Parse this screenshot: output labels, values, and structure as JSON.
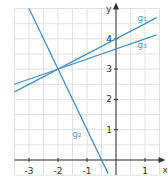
{
  "chart_data": {
    "type": "line",
    "title": "",
    "xlabel": "x",
    "ylabel": "y",
    "xlim": [
      -3.5,
      1.5
    ],
    "ylim": [
      -0.5,
      5.0
    ],
    "grid": true,
    "grid_step": 0.5,
    "x_ticks": [
      -3,
      -2,
      -1,
      1
    ],
    "x_tick_labels": [
      "-3",
      "-2",
      "-1",
      "1"
    ],
    "y_ticks": [
      1,
      2,
      3,
      4
    ],
    "y_tick_labels": [
      "1",
      "2",
      "3",
      "4"
    ],
    "series": [
      {
        "name": "g1",
        "label": "g₁",
        "slope": 0.5,
        "intercept": 4,
        "points": [
          [
            -3.5,
            2.25
          ],
          [
            1.4,
            4.7
          ]
        ]
      },
      {
        "name": "g2",
        "label": "g₂",
        "slope": -2,
        "intercept": -1,
        "points": [
          [
            -3.0,
            5.0
          ],
          [
            -0.27,
            -0.45
          ]
        ]
      },
      {
        "name": "g3",
        "label": "g₃",
        "slope": 0.3333,
        "intercept": 3.6667,
        "points": [
          [
            -3.5,
            2.5
          ],
          [
            1.4,
            4.13
          ]
        ]
      }
    ],
    "intersection": [
      -2,
      3
    ],
    "annotations": [
      {
        "text": "g₁",
        "x": 0.9,
        "y": 4.6
      },
      {
        "text": "g₃",
        "x": 0.9,
        "y": 3.7
      },
      {
        "text": "g₂",
        "x": -1.35,
        "y": 0.75
      }
    ]
  },
  "colors": {
    "line": "#4a8fc4",
    "label": "#5a9bd0",
    "axis": "#333333",
    "grid": "#e2e2e2",
    "tick_text": "#333333"
  },
  "axis_labels": {
    "x": "x",
    "y": "y"
  }
}
